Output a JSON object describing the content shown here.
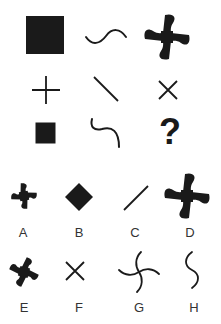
{
  "puzzle": {
    "grid": [
      [
        {
          "shape": "large-filled-square"
        },
        {
          "shape": "wave-horizontal"
        },
        {
          "shape": "large-pinwheel"
        }
      ],
      [
        {
          "shape": "plus-cross"
        },
        {
          "shape": "diagonal-line-backslash"
        },
        {
          "shape": "x-cross"
        }
      ],
      [
        {
          "shape": "small-filled-square"
        },
        {
          "shape": "s-curve-hook"
        },
        {
          "shape": "question-mark",
          "text": "?"
        }
      ]
    ],
    "question_mark": "?"
  },
  "options": [
    {
      "label": "A",
      "shape": "small-pinwheel"
    },
    {
      "label": "B",
      "shape": "filled-diamond"
    },
    {
      "label": "C",
      "shape": "diagonal-line-slash"
    },
    {
      "label": "D",
      "shape": "large-pinwheel"
    },
    {
      "label": "E",
      "shape": "small-pinwheel-rotated"
    },
    {
      "label": "F",
      "shape": "x-cross"
    },
    {
      "label": "G",
      "shape": "curved-pinwheel-outline"
    },
    {
      "label": "H",
      "shape": "s-curve-vertical"
    }
  ],
  "colors": {
    "ink": "#1a1a1a",
    "label": "#333333",
    "background": "#ffffff"
  }
}
